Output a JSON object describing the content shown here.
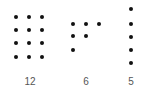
{
  "colors": {
    "dot": "#111111",
    "label": "#555555",
    "background": "#ffffff"
  },
  "groups": [
    {
      "label": "12",
      "count": 12,
      "arrangement": "3 columns x 4 rows grid",
      "dots": [
        [
          16,
          17
        ],
        [
          29,
          17
        ],
        [
          42,
          17
        ],
        [
          16,
          30
        ],
        [
          29,
          30
        ],
        [
          42,
          30
        ],
        [
          16,
          43
        ],
        [
          29,
          43
        ],
        [
          42,
          43
        ],
        [
          16,
          57
        ],
        [
          29,
          57
        ],
        [
          42,
          57
        ]
      ],
      "label_center_x": 30
    },
    {
      "label": "6",
      "count": 6,
      "arrangement": "staircase: 3, 2, 1",
      "dots": [
        [
          73,
          24
        ],
        [
          86,
          24
        ],
        [
          99,
          24
        ],
        [
          73,
          36
        ],
        [
          86,
          36
        ],
        [
          73,
          50
        ]
      ],
      "label_center_x": 86
    },
    {
      "label": "5",
      "count": 5,
      "arrangement": "single vertical column",
      "dots": [
        [
          131,
          9
        ],
        [
          131,
          24
        ],
        [
          131,
          37
        ],
        [
          131,
          50
        ],
        [
          131,
          63
        ]
      ],
      "label_center_x": 131
    }
  ]
}
